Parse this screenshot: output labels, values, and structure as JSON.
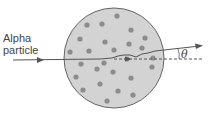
{
  "diagram": {
    "label_line1": "Alpha",
    "label_line2": "particle",
    "angle_symbol": "θ",
    "colors": {
      "background": "#ffffff",
      "atom_fill": "#d3d3d3",
      "atom_stroke": "#666666",
      "dot": "#8c8c8c",
      "path": "#555555",
      "text": "#444444"
    },
    "atom": {
      "cx": 114,
      "cy": 58,
      "r": 50
    },
    "dots": [
      [
        117,
        16
      ],
      [
        87,
        25
      ],
      [
        102,
        24
      ],
      [
        131,
        30
      ],
      [
        80,
        39
      ],
      [
        105,
        42
      ],
      [
        145,
        38
      ],
      [
        129,
        44
      ],
      [
        142,
        48
      ],
      [
        70,
        52
      ],
      [
        89,
        51
      ],
      [
        114,
        50
      ],
      [
        127,
        59
      ],
      [
        153,
        58
      ],
      [
        81,
        64
      ],
      [
        104,
        63
      ],
      [
        97,
        69
      ],
      [
        113,
        72
      ],
      [
        152,
        67
      ],
      [
        76,
        77
      ],
      [
        131,
        78
      ],
      [
        100,
        84
      ],
      [
        83,
        90
      ],
      [
        118,
        91
      ],
      [
        133,
        95
      ],
      [
        107,
        101
      ]
    ]
  }
}
